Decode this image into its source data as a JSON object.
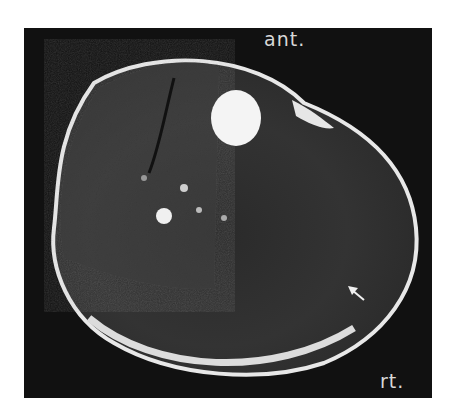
{
  "image": {
    "type": "axial MRI cross-section",
    "labels": {
      "anterior": "ant.",
      "right": "rt."
    },
    "annotations": [
      {
        "type": "arrow",
        "direction": "pointing up-left",
        "position": "lower right region"
      }
    ],
    "colors": {
      "background": "#111111",
      "bright_tissue": "#f2f2f2",
      "soft_tissue": "#3a3a3a"
    }
  }
}
